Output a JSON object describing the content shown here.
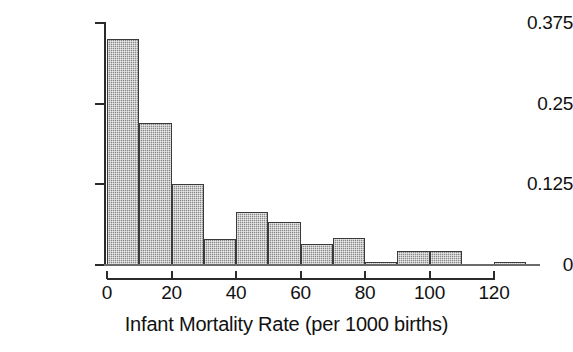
{
  "chart_data": {
    "type": "bar",
    "title": "",
    "subtitle": "",
    "xlabel": "Infant Mortality Rate (per 1000 births)",
    "ylabel": "",
    "grid": false,
    "legend": null,
    "xlim": [
      0,
      130
    ],
    "ylim": [
      0,
      0.375
    ],
    "bin_width": 10,
    "x_tick_labels": [
      "0",
      "20",
      "40",
      "60",
      "80",
      "100",
      "120"
    ],
    "x_ticks": [
      0,
      20,
      40,
      60,
      80,
      100,
      120
    ],
    "y_tick_labels": [
      "0.375",
      "0.25",
      "0.125",
      "0"
    ],
    "y_ticks": [
      0.375,
      0.25,
      0.125,
      0
    ],
    "categories": [
      "0-10",
      "10-20",
      "20-30",
      "30-40",
      "40-50",
      "50-60",
      "60-70",
      "70-80",
      "80-90",
      "90-100",
      "100-110",
      "110-120",
      "120-130"
    ],
    "bin_starts": [
      0,
      10,
      20,
      30,
      40,
      50,
      60,
      70,
      80,
      90,
      100,
      110,
      120
    ],
    "values": [
      0.35,
      0.22,
      0.125,
      0.04,
      0.082,
      0.067,
      0.033,
      0.042,
      0.004,
      0.022,
      0.022,
      0.0,
      0.004
    ],
    "bar_fill_color": "#8a8a8a",
    "bar_edge_color": "#3a3a3a",
    "axis_color": "#2b2b2b",
    "background_color": "#ffffff"
  }
}
